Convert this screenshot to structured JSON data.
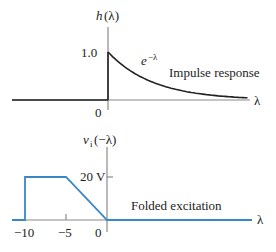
{
  "colors": {
    "axis": "#8a8a8a",
    "impulse_curve": "#222222",
    "excitation_curve": "#3a87c8",
    "text": "#222222"
  },
  "top_plot": {
    "y_label_fn": "h",
    "y_label_arg": "(λ)",
    "x_label": "λ",
    "y_tick": "1.0",
    "origin_label": "0",
    "curve_label_base": "e",
    "curve_label_exp": "−λ",
    "caption": "Impulse response"
  },
  "bottom_plot": {
    "y_label_fn": "v",
    "y_label_sub": "i",
    "y_label_arg": "(−λ)",
    "x_label": "λ",
    "y_tick": "20 V",
    "x_ticks": [
      "−10",
      "−5",
      "0"
    ],
    "caption": "Folded excitation"
  },
  "chart_data": [
    {
      "type": "line",
      "title": "Impulse response",
      "ylabel": "h(λ)",
      "xlabel": "λ",
      "annotation": "e^{−λ}",
      "series": [
        {
          "name": "h(λ)",
          "x": [
            -6,
            0,
            0,
            0.5,
            1,
            1.5,
            2,
            2.5,
            3
          ],
          "y": [
            0,
            0,
            1,
            0.607,
            0.368,
            0.223,
            0.135,
            0.082,
            0.05
          ]
        }
      ],
      "yticks": [
        "1.0"
      ],
      "xticks": [
        "0"
      ]
    },
    {
      "type": "line",
      "title": "Folded excitation",
      "ylabel": "v_i(−λ)",
      "xlabel": "λ",
      "series": [
        {
          "name": "v_i(−λ)",
          "x": [
            -12,
            -10,
            -10,
            -5,
            0,
            18
          ],
          "y": [
            0,
            0,
            20,
            20,
            0,
            0
          ]
        }
      ],
      "yticks": [
        "20 V"
      ],
      "xticks": [
        "−10",
        "−5",
        "0"
      ],
      "y_unit": "V"
    }
  ]
}
